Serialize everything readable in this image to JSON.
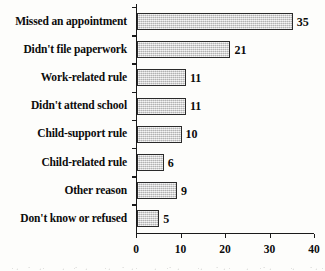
{
  "chart_data": {
    "type": "bar",
    "orientation": "horizontal",
    "title": "",
    "subtitle": "",
    "xlabel": "",
    "ylabel": "",
    "categories": [
      "Missed an appointment",
      "Didn't file paperwork",
      "Work-related rule",
      "Didn't attend school",
      "Child-support rule",
      "Child-related rule",
      "Other reason",
      "Don't know or refused"
    ],
    "values": [
      35,
      21,
      11,
      11,
      10,
      6,
      9,
      5
    ],
    "value_labels": [
      "35",
      "21",
      "11",
      "11",
      "10",
      "6",
      "9",
      "5"
    ],
    "xlim": [
      0,
      40
    ],
    "xticks": [
      0,
      10,
      20,
      30,
      40
    ],
    "xtick_labels": [
      "0",
      "10",
      "20",
      "30",
      "40"
    ],
    "grid": false,
    "legend": false,
    "legend_position": "none",
    "bar_fill_color": "#d2d2d2",
    "bar_edge_color": "#2a2a2a",
    "axis_color": "#1a1a1a",
    "text_color": "#0c0c0c",
    "background_color": "#fdfdfb"
  }
}
